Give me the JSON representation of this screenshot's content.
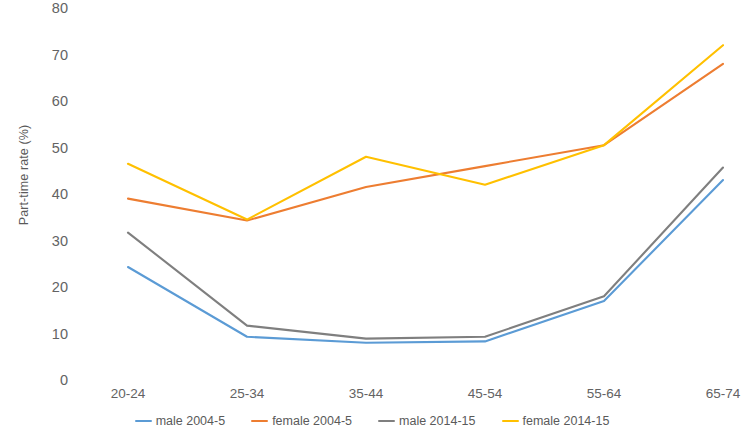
{
  "chart_data": {
    "type": "line",
    "title": "",
    "xlabel": "",
    "ylabel": "Part-time rate (%)",
    "categories": [
      "20-24",
      "25-34",
      "35-44",
      "45-54",
      "55-64",
      "65-74"
    ],
    "ylim": [
      0,
      80
    ],
    "yticks": [
      0,
      10,
      20,
      30,
      40,
      50,
      60,
      70,
      80
    ],
    "grid": false,
    "legend_position": "bottom",
    "series": [
      {
        "name": "male 2004-5",
        "color": "#5B9BD5",
        "values": [
          24.3,
          9.3,
          8.0,
          8.3,
          17.0,
          43.0
        ]
      },
      {
        "name": "female 2004-5",
        "color": "#ED7D31",
        "values": [
          39.0,
          34.3,
          41.5,
          46.0,
          50.5,
          68.0
        ]
      },
      {
        "name": "male 2014-15",
        "color": "#7F7F7F",
        "values": [
          31.7,
          11.7,
          8.9,
          9.3,
          18.0,
          45.7
        ]
      },
      {
        "name": "female 2014-15",
        "color": "#FFC000",
        "values": [
          46.5,
          34.5,
          48.0,
          42.0,
          50.5,
          72.0
        ]
      }
    ]
  }
}
